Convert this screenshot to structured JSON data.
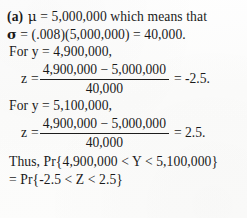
{
  "document": {
    "type": "textbook-solution",
    "part_label": "(a)",
    "background_color": "#fdfdfc",
    "text_color": "#1a1a1a"
  },
  "lines": {
    "mean_statement": {
      "symbol": "μ",
      "equals": "=",
      "value": "5,000,000",
      "trailing_text": "which means that"
    },
    "sd_statement": {
      "symbol": "σ",
      "expression": "= (.008)(5,000,000) = 40,000."
    },
    "for_y_first": "For y = 4,900,000,",
    "for_y_second": "For y = 5,100,000,",
    "thus_line": "Thus, Pr{4,900,000 < Y < 5,100,000}",
    "conclusion_line": "= Pr{-2.5 < Z < 2.5}"
  },
  "equations": [
    {
      "id": "z-score-lower",
      "variable": "z",
      "equals": "=",
      "numerator": "4,900,000 − 5,000,000",
      "denominator": "40,000",
      "result": "= -2.5."
    },
    {
      "id": "z-score-upper",
      "variable": "z",
      "equals": "=",
      "numerator": "4,900,000 − 5,000,000",
      "denominator": "40,000",
      "result": "= 2.5."
    }
  ]
}
